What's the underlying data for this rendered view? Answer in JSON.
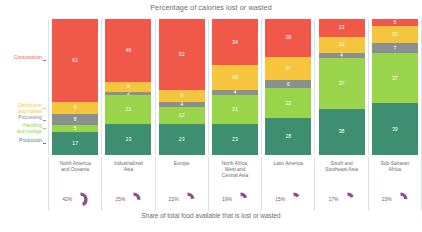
{
  "chart_title": "Percentage of calories lost or wasted",
  "footer_caption": "Share of total food available that is lost or wasted",
  "stage_labels": [
    {
      "name": "Consumption",
      "text": "Consumption",
      "color": "#f0584a"
    },
    {
      "name": "Distribution and market",
      "text": "Distribution\nand market",
      "color": "#f5c53d"
    },
    {
      "name": "Processing",
      "text": "Processing",
      "color": "#8a8f8f"
    },
    {
      "name": "Handling and storage",
      "text": "Handling\nand storage",
      "color": "#9ad44a"
    },
    {
      "name": "Production",
      "text": "Production",
      "color": "#3e8f72"
    }
  ],
  "chart_data": {
    "type": "bar",
    "title": "Percentage of calories lost or wasted",
    "subtitle": "Share of total food available that is lost or wasted",
    "xlabel": "",
    "ylabel": "",
    "ylim": [
      0,
      100
    ],
    "grid": false,
    "legend": "left-axis-labels",
    "stacked": true,
    "categories": [
      "North America and Oceania",
      "Industrialized Asia",
      "Europe",
      "North Africa, West and Central Asia",
      "Latin America",
      "South and Southeast Asia",
      "Sub-Saharan Africa"
    ],
    "series": [
      {
        "name": "Consumption",
        "color": "#f0584a",
        "values": [
          61,
          46,
          52,
          34,
          28,
          13,
          5
        ]
      },
      {
        "name": "Distribution and market",
        "color": "#f5c53d",
        "values": [
          9,
          8,
          9,
          18,
          17,
          12,
          13
        ]
      },
      {
        "name": "Processing",
        "color": "#8a8f8f",
        "values": [
          8,
          2,
          4,
          4,
          6,
          4,
          7
        ]
      },
      {
        "name": "Handling and storage",
        "color": "#9ad44a",
        "values": [
          5,
          21,
          12,
          21,
          22,
          37,
          37
        ]
      },
      {
        "name": "Production",
        "color": "#3e8f72",
        "values": [
          17,
          23,
          23,
          23,
          27,
          34,
          38
        ]
      }
    ]
  },
  "columns": [
    {
      "region": "North America\nand Oceania",
      "share_pct": "42%",
      "share_value": 42,
      "segments": [
        {
          "stage": "Consumption",
          "value": "61",
          "pct": 61,
          "color": "#f0584a"
        },
        {
          "stage": "Distribution and market",
          "value": "9",
          "pct": 9,
          "color": "#f5c53d"
        },
        {
          "stage": "Processing",
          "value": "8",
          "pct": 8,
          "color": "#8a8f8f"
        },
        {
          "stage": "Handling and storage",
          "value": "5",
          "pct": 5,
          "color": "#9ad44a"
        },
        {
          "stage": "Production",
          "value": "17",
          "pct": 17,
          "color": "#3e8f72"
        }
      ]
    },
    {
      "region": "Industrialized\nAsia",
      "share_pct": "25%",
      "share_value": 25,
      "segments": [
        {
          "stage": "Consumption",
          "value": "46",
          "pct": 46,
          "color": "#f0584a"
        },
        {
          "stage": "Distribution and market",
          "value": "8",
          "pct": 8,
          "color": "#f5c53d"
        },
        {
          "stage": "Processing",
          "value": "2",
          "pct": 2,
          "color": "#8a8f8f"
        },
        {
          "stage": "Handling and storage",
          "value": "21",
          "pct": 21,
          "color": "#9ad44a"
        },
        {
          "stage": "Production",
          "value": "23",
          "pct": 23,
          "color": "#3e8f72"
        }
      ]
    },
    {
      "region": "Europe",
      "share_pct": "22%",
      "share_value": 22,
      "segments": [
        {
          "stage": "Consumption",
          "value": "52",
          "pct": 52,
          "color": "#f0584a"
        },
        {
          "stage": "Distribution and market",
          "value": "9",
          "pct": 9,
          "color": "#f5c53d"
        },
        {
          "stage": "Processing",
          "value": "4",
          "pct": 4,
          "color": "#8a8f8f"
        },
        {
          "stage": "Handling and storage",
          "value": "12",
          "pct": 12,
          "color": "#9ad44a"
        },
        {
          "stage": "Production",
          "value": "23",
          "pct": 23,
          "color": "#3e8f72"
        }
      ]
    },
    {
      "region": "North Africa,\nWest and\nCentral Asia",
      "share_pct": "19%",
      "share_value": 19,
      "segments": [
        {
          "stage": "Consumption",
          "value": "34",
          "pct": 34,
          "color": "#f0584a"
        },
        {
          "stage": "Distribution and market",
          "value": "18",
          "pct": 18,
          "color": "#f5c53d"
        },
        {
          "stage": "Processing",
          "value": "4",
          "pct": 4,
          "color": "#8a8f8f"
        },
        {
          "stage": "Handling and storage",
          "value": "21",
          "pct": 21,
          "color": "#9ad44a"
        },
        {
          "stage": "Production",
          "value": "23",
          "pct": 23,
          "color": "#3e8f72"
        }
      ]
    },
    {
      "region": "Latin America",
      "share_pct": "15%",
      "share_value": 15,
      "segments": [
        {
          "stage": "Consumption",
          "value": "28",
          "pct": 28,
          "color": "#f0584a"
        },
        {
          "stage": "Distribution and market",
          "value": "17",
          "pct": 17,
          "color": "#f5c53d"
        },
        {
          "stage": "Processing",
          "value": "6",
          "pct": 6,
          "color": "#8a8f8f"
        },
        {
          "stage": "Handling and storage",
          "value": "22",
          "pct": 22,
          "color": "#9ad44a"
        },
        {
          "stage": "Production",
          "value": "28",
          "pct": 27,
          "color": "#3e8f72"
        }
      ]
    },
    {
      "region": "South and\nSoutheast Asia",
      "share_pct": "17%",
      "share_value": 17,
      "segments": [
        {
          "stage": "Consumption",
          "value": "13",
          "pct": 13,
          "color": "#f0584a"
        },
        {
          "stage": "Distribution and market",
          "value": "12",
          "pct": 12,
          "color": "#f5c53d"
        },
        {
          "stage": "Processing",
          "value": "4",
          "pct": 4,
          "color": "#8a8f8f"
        },
        {
          "stage": "Handling and storage",
          "value": "37",
          "pct": 37,
          "color": "#9ad44a"
        },
        {
          "stage": "Production",
          "value": "38",
          "pct": 34,
          "color": "#3e8f72"
        }
      ]
    },
    {
      "region": "Sub-Saharan\nAfrica",
      "share_pct": "23%",
      "share_value": 23,
      "segments": [
        {
          "stage": "Consumption",
          "value": "5",
          "pct": 5,
          "color": "#f0584a"
        },
        {
          "stage": "Distribution and market",
          "value": "13",
          "pct": 13,
          "color": "#f5c53d"
        },
        {
          "stage": "Processing",
          "value": "7",
          "pct": 7,
          "color": "#8a8f8f"
        },
        {
          "stage": "Handling and storage",
          "value": "37",
          "pct": 37,
          "color": "#9ad44a"
        },
        {
          "stage": "Production",
          "value": "39",
          "pct": 38,
          "color": "#3e8f72"
        }
      ]
    }
  ],
  "colors": {
    "consumption": "#f0584a",
    "distribution": "#f5c53d",
    "processing": "#8a8f8f",
    "handling": "#9ad44a",
    "production": "#3e8f72",
    "donut": "#8e4f8e",
    "donut_track": "#ffffff",
    "divider": "#d9e3ea",
    "text": "#6b6b6b"
  }
}
